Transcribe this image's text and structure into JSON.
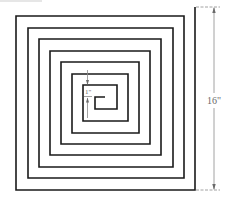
{
  "diagram": {
    "type": "square-spiral",
    "stroke_color": "#1a1a1a",
    "dimension_color": "#7a7a7a",
    "spiral_points": [
      [
        195,
        7
      ],
      [
        195,
        190
      ],
      [
        16,
        190
      ],
      [
        16,
        16
      ],
      [
        184,
        16
      ],
      [
        184,
        178
      ],
      [
        28,
        178
      ],
      [
        28,
        28
      ],
      [
        173,
        28
      ],
      [
        173,
        167
      ],
      [
        39,
        167
      ],
      [
        39,
        39
      ],
      [
        161,
        39
      ],
      [
        161,
        155
      ],
      [
        50,
        155
      ],
      [
        50,
        51
      ],
      [
        150,
        51
      ],
      [
        150,
        144
      ],
      [
        61,
        144
      ],
      [
        61,
        62
      ],
      [
        139,
        62
      ],
      [
        139,
        133
      ],
      [
        72,
        133
      ],
      [
        72,
        74
      ],
      [
        128,
        74
      ],
      [
        128,
        121
      ],
      [
        83,
        121
      ],
      [
        83,
        85
      ],
      [
        117,
        85
      ],
      [
        117,
        109
      ],
      [
        95,
        109
      ],
      [
        95,
        97
      ],
      [
        105,
        97
      ]
    ],
    "dimensions": {
      "overall": {
        "label": "16\"",
        "description": "overall height of spiral"
      },
      "spacing": {
        "label": "1\"",
        "description": "spacing between turns"
      }
    }
  }
}
